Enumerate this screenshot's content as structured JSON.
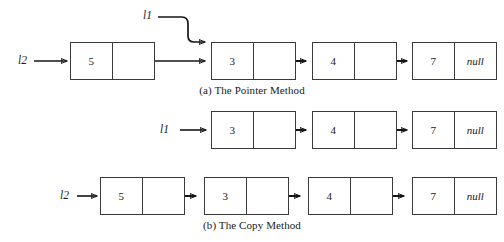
{
  "figure": {
    "background_color": "#ffffff",
    "line_color": "#161616",
    "box_border_color": "#3a3a3a",
    "text_color": "#1a1a1a"
  },
  "diagrams": [
    {
      "id": "pointer-method",
      "caption": "(a) The Pointer Method",
      "pointers": [
        {
          "name": "l1-pointer-top",
          "label": "l1"
        },
        {
          "name": "l2-pointer-top",
          "label": "l2"
        }
      ],
      "nodes": [
        {
          "data": "5",
          "next": "",
          "has_null": false
        },
        {
          "data": "3",
          "next": "",
          "has_null": false
        },
        {
          "data": "4",
          "next": "",
          "has_null": false
        },
        {
          "data": "7",
          "next": "null",
          "has_null": true
        }
      ]
    },
    {
      "id": "copy-method-row1",
      "caption": "",
      "pointers": [
        {
          "name": "l1-pointer-middle",
          "label": "l1"
        }
      ],
      "nodes": [
        {
          "data": "3",
          "next": "",
          "has_null": false
        },
        {
          "data": "4",
          "next": "",
          "has_null": false
        },
        {
          "data": "7",
          "next": "null",
          "has_null": true
        }
      ]
    },
    {
      "id": "copy-method-row2",
      "caption": "(b) The Copy Method",
      "pointers": [
        {
          "name": "l2-pointer-bottom",
          "label": "l2"
        }
      ],
      "nodes": [
        {
          "data": "5",
          "next": "",
          "has_null": false
        },
        {
          "data": "3",
          "next": "",
          "has_null": false
        },
        {
          "data": "4",
          "next": "",
          "has_null": false
        },
        {
          "data": "7",
          "next": "null",
          "has_null": true
        }
      ]
    }
  ],
  "labels": {
    "l1_top": "l1",
    "l2_top": "l2",
    "l1_middle": "l1",
    "l2_bottom": "l2",
    "caption_a": "(a) The Pointer Method",
    "caption_b": "(b) The Copy Method",
    "null_text": "null"
  },
  "values": {
    "top_row": [
      "5",
      "3",
      "4",
      "7"
    ],
    "middle_row": [
      "3",
      "4",
      "7"
    ],
    "bottom_row": [
      "5",
      "3",
      "4",
      "7"
    ]
  }
}
